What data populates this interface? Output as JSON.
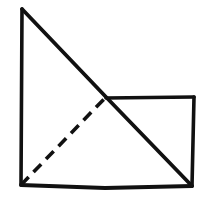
{
  "figure": {
    "background_color": "#ffffff",
    "stroke_color": "#111111",
    "canvas": {
      "width": 217,
      "height": 202
    },
    "points": {
      "apex_top_left": {
        "x": 22,
        "y": 9
      },
      "bottom_left": {
        "x": 21,
        "y": 185
      },
      "bottom_right": {
        "x": 192,
        "y": 186
      },
      "rect_top_right": {
        "x": 194,
        "y": 97
      },
      "intersection_center": {
        "x": 106,
        "y": 97
      }
    },
    "segments": [
      {
        "name": "left-vertical-edge",
        "style": "solid",
        "stroke_width": 3.6,
        "path": "M 22 9 L 21 185"
      },
      {
        "name": "main-diagonal",
        "style": "solid",
        "stroke_width": 3.8,
        "path": "M 22 9 L 106 97 L 192 186"
      },
      {
        "name": "bottom-horizontal-edge",
        "style": "solid",
        "stroke_width": 3.8,
        "path": "M 21 185 L 105 188 L 192 186"
      },
      {
        "name": "rectangle-top-edge",
        "style": "solid",
        "stroke_width": 3.6,
        "path": "M 106 98 L 194 97"
      },
      {
        "name": "rectangle-right-edge",
        "style": "solid",
        "stroke_width": 3.6,
        "path": "M 194 97 L 192 186"
      },
      {
        "name": "dashed-diagonal",
        "style": "dashed",
        "stroke_width": 3.6,
        "dash_pattern": "11 7",
        "path": "M 21 185 L 106 97"
      }
    ]
  }
}
